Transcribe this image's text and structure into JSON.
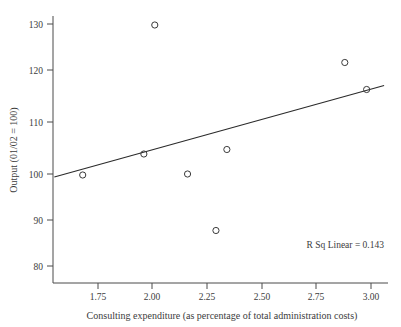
{
  "chart_data": {
    "type": "scatter",
    "title": "",
    "xlabel": "Consulting expenditure (as percentage of total administration costs)",
    "ylabel": "Output (01/02 = 100)",
    "xlim": [
      1.55,
      3.08
    ],
    "ylim": [
      77.0,
      133.0
    ],
    "grid": false,
    "legend": "none",
    "xticks": [
      "1.75",
      "2.00",
      "2.25",
      "2.50",
      "2.75",
      "3.00"
    ],
    "xtick_values": [
      1.75,
      2.0,
      2.25,
      2.5,
      2.75,
      3.0
    ],
    "yticks": [
      "80",
      "90",
      "100",
      "110",
      "120",
      "130"
    ],
    "ytick_values": [
      80,
      90,
      100,
      110,
      120,
      130
    ],
    "x": [
      1.68,
      1.96,
      2.01,
      2.16,
      2.29,
      2.34,
      2.88,
      2.98
    ],
    "y": [
      99.8,
      104.0,
      129.8,
      100.0,
      88.7,
      104.9,
      122.3,
      116.9
    ],
    "points": [
      {
        "x": 1.68,
        "y": 99.8
      },
      {
        "x": 1.96,
        "y": 104.0
      },
      {
        "x": 2.01,
        "y": 129.8
      },
      {
        "x": 2.16,
        "y": 100.0
      },
      {
        "x": 2.29,
        "y": 88.7
      },
      {
        "x": 2.34,
        "y": 104.9
      },
      {
        "x": 2.88,
        "y": 122.3
      },
      {
        "x": 2.98,
        "y": 116.9
      }
    ],
    "fit_line": {
      "type": "linear",
      "x_start": 1.55,
      "y_start": 99.4,
      "x_end": 3.06,
      "y_end": 117.7
    },
    "annotations": [
      {
        "text": "R Sq Linear = 0.143",
        "x": 2.96,
        "y": 85.5
      }
    ],
    "r_squared": 0.143,
    "marker": "open-circle",
    "marker_color": "#3a3a3a",
    "line_color": "#2b2b2b"
  },
  "annotation": {
    "r_sq_label": "R Sq Linear = 0.143"
  },
  "axes": {
    "x_title": "Consulting expenditure (as percentage of total administration costs)",
    "y_title": "Output (01/02 = 100)"
  }
}
